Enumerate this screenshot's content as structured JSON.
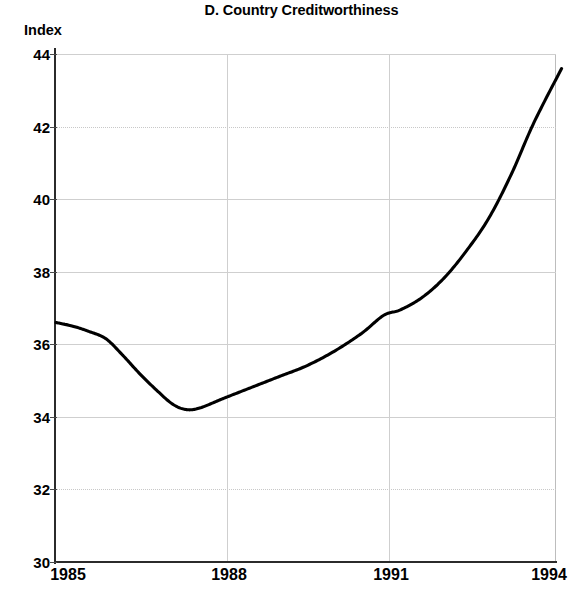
{
  "chart_data": {
    "type": "line",
    "title": "D. Country Creditworthiness",
    "subtitle": "",
    "xlabel": "",
    "ylabel": "Index",
    "xlim": [
      1985,
      1994
    ],
    "ylim": [
      30,
      44
    ],
    "grid": true,
    "legend": "none",
    "x_ticks": [
      "1985",
      "1988",
      "1991",
      "1994"
    ],
    "y_ticks": [
      "30",
      "32",
      "34",
      "36",
      "38",
      "40",
      "42",
      "44"
    ],
    "series": [
      {
        "name": "Country Creditworthiness Index",
        "color": "#000000",
        "x": [
          1985.0,
          1985.3,
          1985.6,
          1985.9,
          1986.2,
          1986.5,
          1986.8,
          1987.1,
          1987.35,
          1987.6,
          1988.0,
          1988.5,
          1989.0,
          1989.5,
          1990.0,
          1990.5,
          1990.9,
          1991.2,
          1991.6,
          1992.0,
          1992.4,
          1992.8,
          1993.2,
          1993.6,
          1994.1
        ],
        "values": [
          36.6,
          36.5,
          36.35,
          36.15,
          35.7,
          35.2,
          34.75,
          34.35,
          34.2,
          34.25,
          34.5,
          34.8,
          35.1,
          35.4,
          35.8,
          36.3,
          36.8,
          36.95,
          37.3,
          37.85,
          38.6,
          39.5,
          40.7,
          42.1,
          43.6
        ]
      }
    ],
    "annotations": [
      {
        "label": "minimum",
        "x": 1987.35,
        "y": 34.2
      },
      {
        "label": "endpoint",
        "x": 1994.1,
        "y": 43.6
      },
      {
        "label": "start",
        "x": 1985.0,
        "y": 36.6
      }
    ],
    "colors": {
      "series_line": "#000000",
      "gridline": "#cfcfcf",
      "axis": "#2b2b2b",
      "background": "#ffffff",
      "text": "#000000"
    }
  }
}
